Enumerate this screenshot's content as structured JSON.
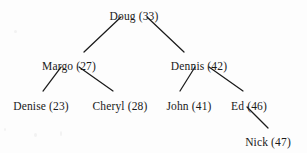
{
  "diagram": {
    "type": "tree",
    "title": "",
    "background_color": "#fdfdfd",
    "line_color": "#1a1a1a",
    "text_color": "#1a1a1a",
    "nodes": [
      {
        "id": "doug",
        "label": "Doug (33)",
        "name": "Doug",
        "value": 33,
        "level": 0,
        "x": 134,
        "y": 10
      },
      {
        "id": "margo",
        "label": "Margo (27)",
        "name": "Margo",
        "value": 27,
        "level": 1,
        "x": 69,
        "y": 60
      },
      {
        "id": "dennis",
        "label": "Dennis (42)",
        "name": "Dennis",
        "value": 42,
        "level": 1,
        "x": 199,
        "y": 60
      },
      {
        "id": "denise",
        "label": "Denise (23)",
        "name": "Denise",
        "value": 23,
        "level": 2,
        "x": 41,
        "y": 100
      },
      {
        "id": "cheryl",
        "label": "Cheryl (28)",
        "name": "Cheryl",
        "value": 28,
        "level": 2,
        "x": 120,
        "y": 100
      },
      {
        "id": "john",
        "label": "John (41)",
        "name": "John",
        "value": 41,
        "level": 2,
        "x": 189,
        "y": 100
      },
      {
        "id": "ed",
        "label": "Ed (46)",
        "name": "Ed",
        "value": 46,
        "level": 2,
        "x": 249,
        "y": 100
      },
      {
        "id": "nick",
        "label": "Nick (47)",
        "name": "Nick",
        "value": 47,
        "level": 3,
        "x": 268,
        "y": 136
      }
    ],
    "edges": [
      {
        "id": "doug-margo",
        "from": "doug",
        "to": "margo",
        "x1": 121,
        "y1": 17,
        "x2": 84,
        "y2": 52
      },
      {
        "id": "doug-dennis",
        "from": "doug",
        "to": "dennis",
        "x1": 147,
        "y1": 17,
        "x2": 184,
        "y2": 52
      },
      {
        "id": "margo-denise",
        "from": "margo",
        "to": "denise",
        "x1": 61,
        "y1": 67,
        "x2": 43,
        "y2": 91
      },
      {
        "id": "margo-cheryl",
        "from": "margo",
        "to": "cheryl",
        "x1": 79,
        "y1": 67,
        "x2": 113,
        "y2": 91
      },
      {
        "id": "dennis-john",
        "from": "dennis",
        "to": "john",
        "x1": 195,
        "y1": 67,
        "x2": 180,
        "y2": 91
      },
      {
        "id": "dennis-ed",
        "from": "dennis",
        "to": "ed",
        "x1": 209,
        "y1": 67,
        "x2": 243,
        "y2": 91
      },
      {
        "id": "ed-nick",
        "from": "ed",
        "to": "nick",
        "x1": 247,
        "y1": 107,
        "x2": 268,
        "y2": 128
      }
    ]
  }
}
